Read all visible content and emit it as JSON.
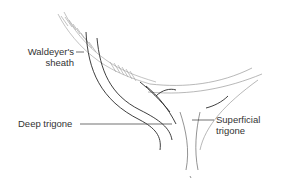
{
  "figure": {
    "type": "anatomical line drawing",
    "labels": {
      "waldeyers_sheath": [
        "Waldeyer's",
        "sheath"
      ],
      "deep_trigone": "Deep trigone",
      "superficial_trigone": [
        "Superficial",
        "trigone"
      ]
    },
    "colors": {
      "background": "#ffffff",
      "dark_line": "#2a2a2a",
      "light_line": "#9a9a9a",
      "label_text": "#333333"
    }
  }
}
